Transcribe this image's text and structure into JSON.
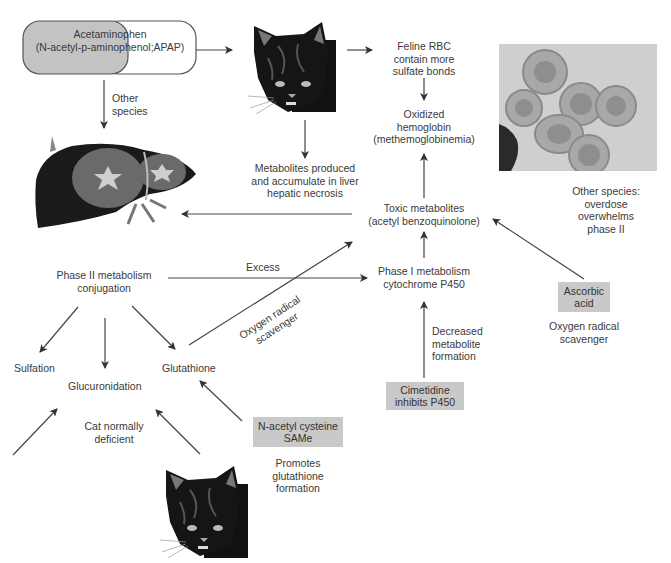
{
  "nodes": {
    "acetaminophen": {
      "line1": "Acetaminophen",
      "line2": "(N-acetyl-p-aminophenol;APAP)"
    },
    "other_species_label": {
      "line1": "Other",
      "line2": "species"
    },
    "feline_rbc": {
      "line1": "Feline RBC",
      "line2": "contain more",
      "line3": "sulfate bonds"
    },
    "oxidized_hb": {
      "line1": "Oxidized",
      "line2": "hemoglobin",
      "line3": "(methemoglobinemia)"
    },
    "metabolites_liver": {
      "line1": "Metabolites produced",
      "line2": "and accumulate in liver",
      "line3": "hepatic necrosis"
    },
    "toxic_metabolites": {
      "line1": "Toxic metabolites",
      "line2": "(acetyl benzoquinolone)"
    },
    "other_species_overdose": {
      "line1": "Other species:",
      "line2": "overdose",
      "line3": "overwhelms",
      "line4": "phase II"
    },
    "phase2": {
      "line1": "Phase II metabolism",
      "line2": "conjugation"
    },
    "excess_label": "Excess",
    "oxygen_scavenger_diag": {
      "line1": "Oxygen radical",
      "line2": "scavenger"
    },
    "phase1": {
      "line1": "Phase I metabolism",
      "line2": "cytochrome P450"
    },
    "ascorbic_acid": {
      "line1": "Ascorbic",
      "line2": "acid"
    },
    "ascorbic_note": {
      "line1": "Oxygen radical",
      "line2": "scavenger"
    },
    "decreased_formation": {
      "line1": "Decreased",
      "line2": "metabolite",
      "line3": "formation"
    },
    "cimetidine": {
      "line1": "Cimetidine",
      "line2": "inhibits P450"
    },
    "sulfation": "Sulfation",
    "glucuronidation": "Glucuronidation",
    "glutathione": "Glutathione",
    "cat_deficient": {
      "line1": "Cat normally",
      "line2": "deficient"
    },
    "nac": {
      "line1": "N-acetyl cysteine",
      "line2": "SAMe"
    },
    "promotes": {
      "line1": "Promotes",
      "line2": "glutathione",
      "line3": "formation"
    }
  },
  "images": {
    "cat_top": "cat-illustration",
    "cat_bottom": "cat-illustration",
    "liver": "liver-illustration",
    "rbc_photo": "red-blood-cells-micrograph"
  },
  "colors": {
    "box_fill": "#c9c9c9",
    "pill_left_fill": "#c3c3c3",
    "arrow": "#333333"
  }
}
